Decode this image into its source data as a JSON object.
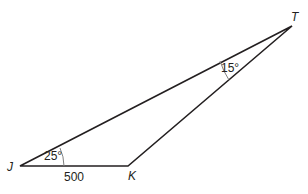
{
  "diagram": {
    "type": "triangle",
    "vertices": {
      "J": {
        "label": "J",
        "x": 20,
        "y": 166
      },
      "K": {
        "label": "K",
        "x": 128,
        "y": 166
      },
      "T": {
        "label": "T",
        "x": 292,
        "y": 26
      }
    },
    "angles": {
      "J": {
        "label": "25°"
      },
      "T": {
        "label": "15°"
      }
    },
    "sides": {
      "JK": {
        "label": "500"
      }
    },
    "colors": {
      "stroke": "#231f20",
      "arc": "#808080"
    }
  }
}
